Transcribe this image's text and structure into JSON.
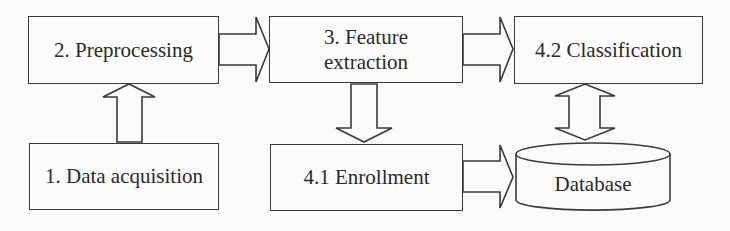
{
  "diagram": {
    "title": "",
    "nodes": {
      "preprocessing": {
        "label": "2. Preprocessing"
      },
      "data_acquisition": {
        "label": "1. Data acquisition"
      },
      "feature_extraction": {
        "label_line1": "3. Feature",
        "label_line2": "extraction"
      },
      "enrollment": {
        "label": "4.1 Enrollment"
      },
      "classification": {
        "label": "4.2 Classification"
      },
      "database": {
        "label": "Database",
        "shape": "cylinder"
      }
    },
    "edges": [
      {
        "from": "1. Data acquisition",
        "to": "2. Preprocessing",
        "type": "block-arrow-up"
      },
      {
        "from": "2. Preprocessing",
        "to": "3. Feature extraction",
        "type": "block-arrow-right"
      },
      {
        "from": "3. Feature extraction",
        "to": "4.1 Enrollment",
        "type": "block-arrow-down"
      },
      {
        "from": "3. Feature extraction",
        "to": "4.2 Classification",
        "type": "block-arrow-right"
      },
      {
        "from": "4.1 Enrollment",
        "to": "Database",
        "type": "block-arrow-right"
      },
      {
        "from": "4.2 Classification",
        "to": "Database",
        "type": "block-arrow-bidirectional-vertical"
      }
    ],
    "colors": {
      "stroke": "#3a3a3a",
      "fill": "#fbfbfb",
      "text": "#2a2a2a",
      "background": "#fafafa"
    }
  }
}
